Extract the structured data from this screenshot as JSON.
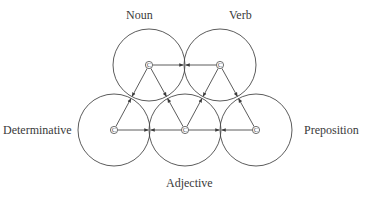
{
  "diagram": {
    "colors": {
      "stroke": "#4a4a4a",
      "text": "#3a3a3a",
      "background": "#ffffff"
    },
    "circle_radius": 36,
    "node_glyph": "C",
    "nodes": [
      {
        "id": "noun",
        "label": "Noun",
        "cx": 149,
        "cy": 65,
        "label_x": 126,
        "label_y": 9
      },
      {
        "id": "verb",
        "label": "Verb",
        "cx": 220,
        "cy": 65,
        "label_x": 229,
        "label_y": 9
      },
      {
        "id": "determinative",
        "label": "Determinative",
        "cx": 114,
        "cy": 130,
        "label_x": 3,
        "label_y": 124
      },
      {
        "id": "adjective",
        "label": "Adjective",
        "cx": 185,
        "cy": 130,
        "label_x": 166,
        "label_y": 177
      },
      {
        "id": "preposition",
        "label": "Preposition",
        "cx": 256,
        "cy": 130,
        "label_x": 304,
        "label_y": 124
      }
    ],
    "edges": [
      {
        "from": "noun",
        "to": "verb",
        "bidirectional": true
      },
      {
        "from": "noun",
        "to": "determinative",
        "bidirectional": true
      },
      {
        "from": "noun",
        "to": "adjective",
        "bidirectional": true
      },
      {
        "from": "verb",
        "to": "adjective",
        "bidirectional": true
      },
      {
        "from": "verb",
        "to": "preposition",
        "bidirectional": true
      },
      {
        "from": "determinative",
        "to": "adjective",
        "bidirectional": true
      },
      {
        "from": "adjective",
        "to": "preposition",
        "bidirectional": true
      }
    ]
  }
}
